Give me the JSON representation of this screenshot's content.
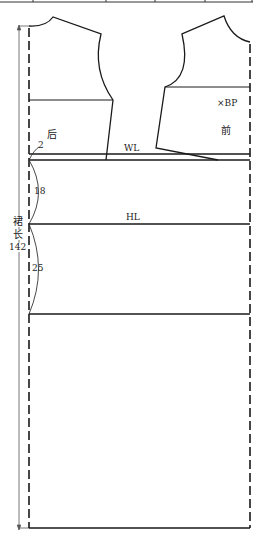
{
  "diagram": {
    "type": "dress-pattern-draft",
    "labels": {
      "back_piece": "后",
      "front_piece": "前",
      "bust_point": "×BP",
      "waist_line": "WL",
      "hip_line": "HL",
      "dress_length_line1": "裙",
      "dress_length_line2": "长",
      "dress_length_value": "142",
      "waist_drop": "2",
      "waist_to_hip": "18",
      "hip_to_line": "25"
    },
    "colors": {
      "line": "#1a1a1a",
      "thin_line": "#555555",
      "background": "#ffffff"
    }
  }
}
